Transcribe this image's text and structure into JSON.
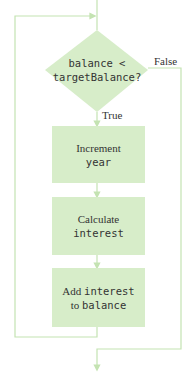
{
  "diagram": {
    "type": "flowchart",
    "colors": {
      "fill": "#d7edc9",
      "line": "#c4e3b2",
      "text": "#333333"
    },
    "decision": {
      "condition_line1": "balance <",
      "condition_line2": "targetBalance?",
      "true_label": "True",
      "false_label": "False"
    },
    "steps": [
      {
        "text_plain": "Increment",
        "text_code": "year"
      },
      {
        "text_plain": "Calculate",
        "text_code": "interest"
      },
      {
        "text_plain_prefix": "Add",
        "text_code_a": "interest",
        "text_plain_mid": "to",
        "text_code_b": "balance"
      }
    ]
  }
}
